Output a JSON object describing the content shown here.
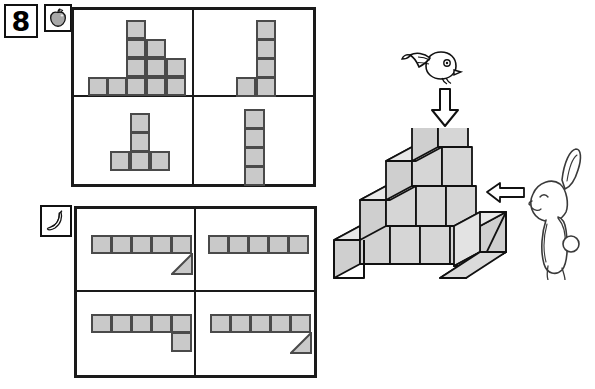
{
  "page": {
    "number_label": "8",
    "background": "#ffffff",
    "ink": "#1a1a1a",
    "cube_fill": "#c9c9c9",
    "cube_edge": "#4a4a4a"
  },
  "badges": [
    {
      "name": "number-badge",
      "text": "8",
      "x": 4,
      "y": 4,
      "w": 34,
      "h": 34
    },
    {
      "name": "apple-badge",
      "icon": "apple-icon",
      "x": 44,
      "y": 4,
      "w": 28,
      "h": 28
    },
    {
      "name": "banana-badge",
      "icon": "banana-icon",
      "x": 40,
      "y": 205,
      "w": 32,
      "h": 32
    }
  ],
  "panels": [
    {
      "name": "apple-panel",
      "x": 71,
      "y": 7,
      "w": 245,
      "h": 180,
      "options": [
        {
          "name": "option-a",
          "label": "staircase-pyramid",
          "description": "Pyramid: bottom row 5 cells, then 3, then 2, then 1",
          "rows": [
            5,
            3,
            2,
            1
          ]
        },
        {
          "name": "option-b",
          "label": "L-tetromino-tall",
          "description": "Vertical column of 4 cells with one cell at lower-left",
          "rows": [
            1,
            1,
            1,
            2
          ]
        },
        {
          "name": "option-c",
          "label": "T-shape",
          "description": "Vertical column of 2 cells sitting on a row of 3",
          "rows": [
            1,
            1,
            3
          ]
        },
        {
          "name": "option-d",
          "label": "I-tetromino",
          "description": "Single vertical column of 4 cells",
          "rows": [
            1,
            1,
            1,
            1
          ]
        }
      ]
    },
    {
      "name": "banana-panel",
      "x": 74,
      "y": 206,
      "w": 243,
      "h": 172,
      "options": [
        {
          "name": "option-e",
          "label": "row-with-triangle-right",
          "description": "Row of 5 cells with a triangle wedge below the right end",
          "cells": 5,
          "triangle": "below-right"
        },
        {
          "name": "option-f",
          "label": "plain-row",
          "description": "Plain horizontal row of 5 cells",
          "cells": 5,
          "triangle": "none"
        },
        {
          "name": "option-g",
          "label": "row-with-square-right",
          "description": "Row of 5 cells with one square below the right end",
          "cells": 5,
          "triangle": "square-below-right"
        },
        {
          "name": "option-h",
          "label": "row-with-triangle-right-2",
          "description": "Row of 5 cells with a triangle wedge below the right end",
          "cells": 5,
          "triangle": "below-right"
        }
      ]
    }
  ],
  "scene": {
    "name": "isometric-block-scene",
    "bird": {
      "name": "bird-icon",
      "x": 400,
      "y": 48
    },
    "down_arrow": {
      "name": "down-arrow-icon",
      "x": 432,
      "y": 86
    },
    "left_arrow": {
      "name": "left-arrow-icon",
      "x": 487,
      "y": 180
    },
    "rabbit": {
      "name": "rabbit-icon",
      "x": 523,
      "y": 143
    },
    "structure": {
      "name": "isometric-staircase",
      "description": "Isometric staircase of cubes, 4 steps rising left to right, with a flat base slab",
      "column_heights": [
        1,
        2,
        3,
        4
      ],
      "base_depth": 1
    }
  }
}
